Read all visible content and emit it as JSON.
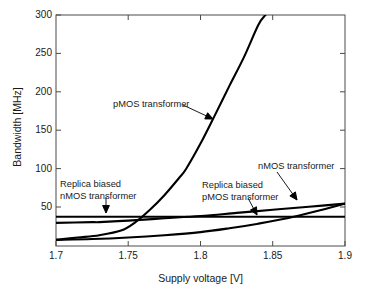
{
  "chart_data": {
    "type": "line",
    "title": "",
    "xlabel": "Supply voltage [V]",
    "ylabel": "Bandwidth [MHz]",
    "xlim": [
      1.7,
      1.9
    ],
    "ylim": [
      0,
      300
    ],
    "xticks": [
      "1.7",
      "1.75",
      "1.8",
      "1.85",
      "1.9"
    ],
    "xtick_values": [
      1.7,
      1.75,
      1.8,
      1.85,
      1.9
    ],
    "yticks": [
      "50",
      "100",
      "150",
      "200",
      "250",
      "300"
    ],
    "ytick_values": [
      50,
      100,
      150,
      200,
      250,
      300
    ],
    "grid": false,
    "legend": "none (curves labelled with leader-line annotations)",
    "line_color": "#000000",
    "series": [
      {
        "name": "pMOS transformer",
        "x": [
          1.7,
          1.715,
          1.73,
          1.745,
          1.755,
          1.765,
          1.775,
          1.785,
          1.79,
          1.8,
          1.81,
          1.82,
          1.83,
          1.84,
          1.845
        ],
        "y": [
          8,
          11,
          14,
          20,
          31,
          47,
          66,
          88,
          100,
          133,
          170,
          208,
          245,
          287,
          300
        ]
      },
      {
        "name": "Replica biased nMOS transformer",
        "x": [
          1.7,
          1.75,
          1.8,
          1.85,
          1.9
        ],
        "y": [
          38,
          38,
          38,
          38,
          38
        ]
      },
      {
        "name": "nMOS transformer",
        "x": [
          1.7,
          1.725,
          1.73,
          1.75,
          1.775,
          1.8,
          1.825,
          1.85,
          1.875,
          1.9
        ],
        "y": [
          30,
          31,
          31,
          33,
          36,
          39,
          43,
          47,
          51,
          55
        ]
      },
      {
        "name": "Replica biased pMOS transformer",
        "x": [
          1.7,
          1.725,
          1.75,
          1.775,
          1.8,
          1.82,
          1.84,
          1.86,
          1.88,
          1.9
        ],
        "y": [
          8,
          9,
          11,
          14,
          18,
          23,
          29,
          36,
          45,
          55
        ]
      }
    ],
    "annotations": [
      {
        "name": "pMOS transformer",
        "lines": [
          "pMOS transformer"
        ],
        "text_x": 113,
        "text_y": 99,
        "arrow_from": [
          183,
          105
        ],
        "arrow_to": [
          213,
          119
        ]
      },
      {
        "name": "Replica biased nMOS transformer",
        "lines": [
          "Replica biased",
          "nMOS transformer"
        ],
        "text_x": 60,
        "text_y": 179,
        "arrow_from": [
          106,
          197
        ],
        "arrow_to": [
          106,
          213
        ]
      },
      {
        "name": "Replica biased pMOS transformer",
        "lines": [
          "Replica biased",
          "pMOS transformer"
        ],
        "text_x": 202,
        "text_y": 180,
        "arrow_from": [
          248,
          198
        ],
        "arrow_to": [
          257,
          215
        ]
      },
      {
        "name": "nMOS transformer",
        "lines": [
          "nMOS transformer"
        ],
        "text_x": 258,
        "text_y": 161,
        "arrow_from": [
          277,
          172
        ],
        "arrow_to": [
          297,
          200
        ]
      }
    ]
  }
}
